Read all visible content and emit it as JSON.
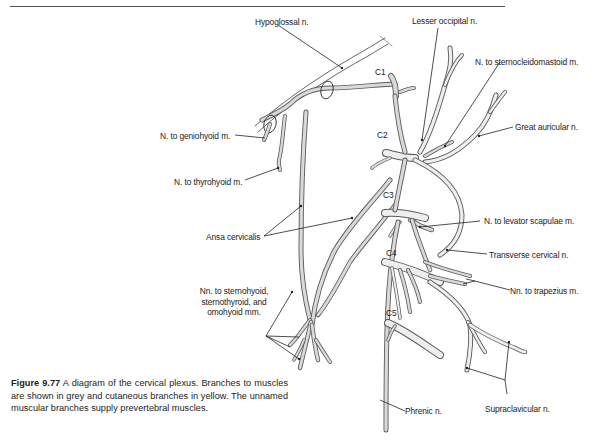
{
  "figure": {
    "number": "Figure 9.77",
    "caption": "A diagram of the cervical plexus. Branches to muscles are shown in grey and cutaneous branches in yellow. The unnamed muscular branches supply prevertebral muscles."
  },
  "colors": {
    "nerve_fill": "#d6d6d6",
    "nerve_fill_light": "#ebebeb",
    "nerve_outline": "#5a5a5a",
    "leader_line": "#222222",
    "background": "#ffffff"
  },
  "roots": [
    {
      "id": "c1",
      "label": "C1"
    },
    {
      "id": "c2",
      "label": "C2"
    },
    {
      "id": "c3",
      "label": "C3"
    },
    {
      "id": "c4",
      "label": "C4"
    },
    {
      "id": "c5",
      "label": "C5"
    }
  ],
  "labels": {
    "hypoglossal": "Hypoglossal n.",
    "lesser_occipital": "Lesser occipital n.",
    "sternocleidomastoid": "N. to sternocleidomastoid m.",
    "great_auricular": "Great auricular n.",
    "geniohyoid": "N. to geniohyoid m.",
    "thyrohyoid": "N. to thyrohyoid m.",
    "ansa_cervicalis": "Ansa cervicalis",
    "levator_scapulae": "N. to levator scapulae m.",
    "transverse_cervical": "Transverse cervical n.",
    "trapezius": "Nn. to trapezius m.",
    "infrahyoid_line1": "Nn. to sternohyoid,",
    "infrahyoid_line2": "sternothyroid, and",
    "infrahyoid_line3": "omohyoid mm.",
    "phrenic": "Phrenic n.",
    "supraclavicular": "Supraclavicular n."
  }
}
